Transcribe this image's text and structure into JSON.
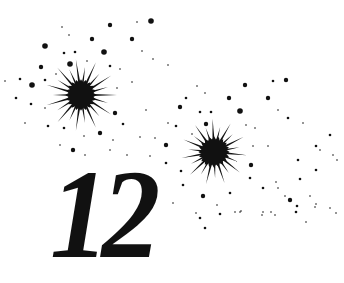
{
  "illustration": {
    "numeral": "12",
    "ink_color": "#111111",
    "background": "#ffffff",
    "starbursts": [
      {
        "cx": 81,
        "cy": 95,
        "core_r": 14,
        "ray_len": 36,
        "rays": 22
      },
      {
        "cx": 214,
        "cy": 152,
        "core_r": 14,
        "ray_len": 33,
        "rays": 22
      }
    ],
    "dots": [
      [
        62,
        27,
        1
      ],
      [
        69,
        35,
        1
      ],
      [
        110,
        25,
        3
      ],
      [
        151,
        21,
        4
      ],
      [
        137,
        22,
        1
      ],
      [
        92,
        39,
        3
      ],
      [
        132,
        39,
        3
      ],
      [
        45,
        46,
        4
      ],
      [
        64,
        53,
        2
      ],
      [
        75,
        52,
        2
      ],
      [
        104,
        52,
        4
      ],
      [
        142,
        51,
        1
      ],
      [
        153,
        59,
        1
      ],
      [
        70,
        64,
        4
      ],
      [
        41,
        67,
        3
      ],
      [
        87,
        61,
        1
      ],
      [
        110,
        66,
        2
      ],
      [
        120,
        69,
        1
      ],
      [
        168,
        65,
        1
      ],
      [
        5,
        81,
        1
      ],
      [
        20,
        79,
        2
      ],
      [
        32,
        85,
        4
      ],
      [
        45,
        80,
        2
      ],
      [
        56,
        74,
        1
      ],
      [
        117,
        88,
        1
      ],
      [
        132,
        82,
        1
      ],
      [
        146,
        110,
        1
      ],
      [
        16,
        98,
        2
      ],
      [
        31,
        104,
        2
      ],
      [
        45,
        108,
        1
      ],
      [
        115,
        113,
        3
      ],
      [
        123,
        124,
        2
      ],
      [
        25,
        123,
        1
      ],
      [
        48,
        126,
        2
      ],
      [
        64,
        128,
        2
      ],
      [
        84,
        136,
        1
      ],
      [
        100,
        133,
        3
      ],
      [
        113,
        140,
        1
      ],
      [
        140,
        137,
        1
      ],
      [
        155,
        138,
        1
      ],
      [
        168,
        123,
        1
      ],
      [
        197,
        86,
        1
      ],
      [
        205,
        93,
        1
      ],
      [
        186,
        98,
        2
      ],
      [
        245,
        85,
        3
      ],
      [
        273,
        81,
        2
      ],
      [
        286,
        80,
        3
      ],
      [
        229,
        98,
        3
      ],
      [
        268,
        98,
        3
      ],
      [
        180,
        107,
        3
      ],
      [
        200,
        112,
        2
      ],
      [
        211,
        112,
        2
      ],
      [
        240,
        111,
        4
      ],
      [
        278,
        110,
        1
      ],
      [
        288,
        118,
        2
      ],
      [
        303,
        123,
        1
      ],
      [
        176,
        126,
        2
      ],
      [
        206,
        124,
        3
      ],
      [
        192,
        134,
        1
      ],
      [
        246,
        125,
        1
      ],
      [
        255,
        128,
        1
      ],
      [
        330,
        135,
        2
      ],
      [
        73,
        150,
        3
      ],
      [
        60,
        145,
        1
      ],
      [
        110,
        150,
        1
      ],
      [
        85,
        155,
        1
      ],
      [
        127,
        155,
        1
      ],
      [
        150,
        156,
        1
      ],
      [
        166,
        145,
        3
      ],
      [
        166,
        163,
        2
      ],
      [
        253,
        146,
        1
      ],
      [
        268,
        146,
        1
      ],
      [
        316,
        146,
        2
      ],
      [
        320,
        150,
        1
      ],
      [
        181,
        171,
        2
      ],
      [
        251,
        165,
        3
      ],
      [
        298,
        160,
        2
      ],
      [
        337,
        160,
        1
      ],
      [
        250,
        178,
        2
      ],
      [
        276,
        182,
        1
      ],
      [
        300,
        179,
        2
      ],
      [
        316,
        170,
        2
      ],
      [
        333,
        155,
        1
      ],
      [
        183,
        185,
        2
      ],
      [
        203,
        196,
        3
      ],
      [
        230,
        193,
        2
      ],
      [
        263,
        188,
        2
      ],
      [
        285,
        196,
        1
      ],
      [
        310,
        196,
        1
      ],
      [
        173,
        203,
        1
      ],
      [
        217,
        205,
        1
      ],
      [
        235,
        212,
        1
      ],
      [
        262,
        215,
        1
      ],
      [
        278,
        188,
        1
      ],
      [
        290,
        200,
        3
      ],
      [
        297,
        206,
        2
      ],
      [
        315,
        207,
        1
      ],
      [
        336,
        213,
        1
      ],
      [
        200,
        218,
        2
      ],
      [
        220,
        214,
        2
      ],
      [
        241,
        211,
        1
      ],
      [
        271,
        212,
        1
      ],
      [
        296,
        212,
        2
      ],
      [
        316,
        204,
        1
      ],
      [
        330,
        208,
        1
      ],
      [
        196,
        213,
        1
      ],
      [
        205,
        228,
        2
      ],
      [
        240,
        212,
        1
      ],
      [
        263,
        212,
        1
      ],
      [
        275,
        215,
        1
      ],
      [
        306,
        222,
        1
      ]
    ]
  }
}
